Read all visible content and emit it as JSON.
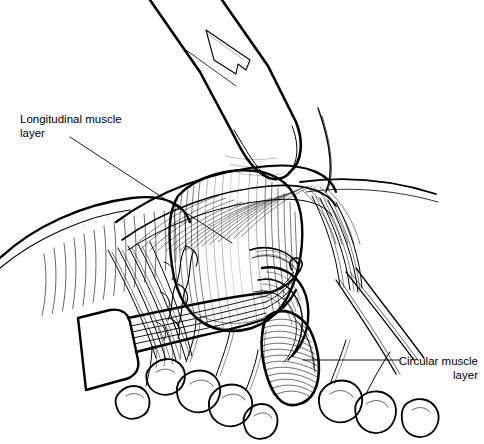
{
  "figure": {
    "type": "medical-surgical-illustration",
    "style": "black-and-white pen-and-ink line drawing",
    "background_color": "#ffffff",
    "ink_color": "#000000",
    "width": 484,
    "height": 444
  },
  "annotations": {
    "longitudinal": {
      "text": "Longitudinal muscle\nlayer",
      "line1": "Longitudinal muscle",
      "line2": "layer",
      "align": "left",
      "leader": {
        "from_x": 70,
        "from_y": 137,
        "to_x": 232,
        "to_y": 243
      }
    },
    "circular": {
      "text": "Circular muscle\nlayer",
      "line1": "Circular muscle",
      "line2": "layer",
      "align": "right",
      "leader": {
        "from_x": 399,
        "from_y": 360,
        "to_x": 303,
        "to_y": 360
      }
    }
  },
  "structures": [
    {
      "name": "surgeon-fingertip",
      "description": "Gloved fingertip with nail retracting tissue superiorly"
    },
    {
      "name": "longitudinal-muscle-layer",
      "description": "Pale bulging longitudinal muscle bundle, vertically hatched"
    },
    {
      "name": "circular-muscle-layer",
      "description": "Oval circular muscle bulge with dense transverse hatching"
    },
    {
      "name": "dissector-instrument",
      "description": "Surgical dissector / elevator entering from lower left"
    },
    {
      "name": "fibrous-tissue-left",
      "description": "Retracted fascia and fibrous strands on the left"
    },
    {
      "name": "adipose-lobules",
      "description": "Lobular fatty tissue along the inferior margin"
    }
  ]
}
